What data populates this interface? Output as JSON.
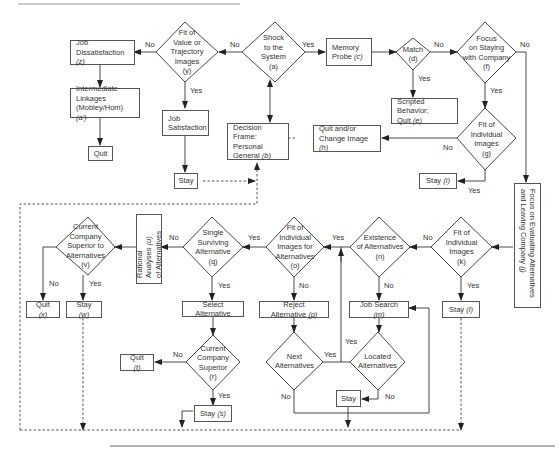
{
  "diagram": {
    "nodes": {
      "job_dissatisfaction": {
        "label": "Job",
        "label2": "Dissatisfaction",
        "tag": "(z)"
      },
      "intermediate_linkages": {
        "label": "Intermediate",
        "label2": "Linkages",
        "label3": "(Mobley/Hom)",
        "tag": "(a')"
      },
      "quit_top": {
        "label": "Quit"
      },
      "fit_value": {
        "label": "Fit of\nValue or\nTrajectory\nImages\n(y)"
      },
      "job_satisfaction": {
        "label": "Job",
        "label2": "Satisfaction"
      },
      "stay_top": {
        "label": "Stay"
      },
      "shock": {
        "label": "Shock\nto the\nSystem\n(a)"
      },
      "decision_frame": {
        "label": "Decision Frame:",
        "label2": "Personal",
        "label3": "General",
        "tag": "(b)"
      },
      "memory_probe": {
        "label": "Memory",
        "label2": "Probe",
        "tag": "(c)"
      },
      "match": {
        "label": "Match\n(d)"
      },
      "scripted_behavior": {
        "label": "Scripted Behavior;",
        "label2": "Quit",
        "tag": "(e)"
      },
      "focus_staying": {
        "label": "Focus\non Staying\nwith Company\n(f)"
      },
      "fit_individual_g": {
        "label": "Fit of\nIndividual\nImages\n(g)"
      },
      "quit_change_image": {
        "label": "Quit and/or",
        "label2": "Change Image",
        "tag": "(h)"
      },
      "stay_i": {
        "label": "Stay",
        "tag": "(i)"
      },
      "focus_evaluating": {
        "label": "Focus on Evaluating Alternatives",
        "label2": "and Leaving Company",
        "tag": "(j)"
      },
      "fit_individual_k": {
        "label": "Fit of\nIndividual\nImages\n(k)"
      },
      "stay_l": {
        "label": "Stay",
        "tag": "(l)"
      },
      "existence_alternatives": {
        "label": "Existence\nof Alternatives\n(n)"
      },
      "job_search": {
        "label": "Job Search",
        "tag": "(m)"
      },
      "fit_images_alternatives": {
        "label": "Fit of\nIndividual\nImages for\nAlternatives\n(o)"
      },
      "reject_alternative": {
        "label": "Reject Alternative",
        "tag": "(p)"
      },
      "next_alternatives": {
        "label": "Next\nAlternatives"
      },
      "located_alternatives": {
        "label": "Located\nAlternatives"
      },
      "stay_bottom": {
        "label": "Stay"
      },
      "single_surviving": {
        "label": "Single\nSurviving\nAlternative\n(q)"
      },
      "select_alternative": {
        "label": "Select Alternative"
      },
      "current_company_superior": {
        "label": "Current\nCompany\nSuperior\n(r)"
      },
      "stay_s": {
        "label": "Stay",
        "tag": "(s)"
      },
      "quit_t": {
        "label": "Quit",
        "tag": "(t)"
      },
      "rational_analyses": {
        "label": "Rational Analyses",
        "label2": "of Alternatives",
        "tag": "(u)"
      },
      "current_superior_alternatives": {
        "label": "Current\nCompany\nSuperior to\nAlternatives\n(v)"
      },
      "stay_w": {
        "label": "Stay",
        "tag": "(w)"
      },
      "quit_x": {
        "label": "Quit",
        "tag": "(x)"
      }
    },
    "edge_labels": {
      "yes": "Yes",
      "no": "No"
    },
    "colors": {
      "line": "#333333",
      "box_border": "#555555",
      "text": "#333333",
      "rule": "#999999"
    }
  }
}
